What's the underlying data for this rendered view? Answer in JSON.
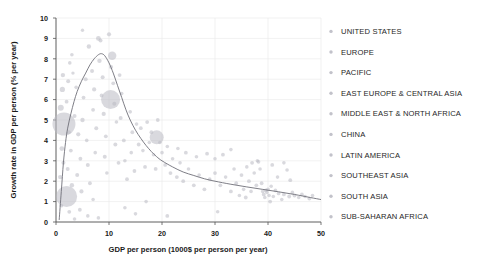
{
  "chart_data": {
    "type": "scatter",
    "title": "",
    "xlabel": "GDP per person (1000$ per person per year)",
    "ylabel": "Growth rate in GDP per person (% per year)",
    "xlim": [
      0,
      50
    ],
    "ylim": [
      0,
      10
    ],
    "xticks": [
      0,
      10,
      20,
      30,
      40,
      50
    ],
    "yticks": [
      0,
      1,
      2,
      3,
      4,
      5,
      6,
      7,
      8,
      9,
      10
    ],
    "grid": true,
    "legend_position": "right",
    "legend": [
      {
        "label": "UNITED STATES",
        "color": "#c2c2ca"
      },
      {
        "label": "EUROPE",
        "color": "#c2c2ca"
      },
      {
        "label": "PACIFIC",
        "color": "#c2c2ca"
      },
      {
        "label": "EAST EUROPE & CENTRAL ASIA",
        "color": "#c2c2ca"
      },
      {
        "label": "MIDDLE EAST & NORTH AFRICA",
        "color": "#c2c2ca"
      },
      {
        "label": "CHINA",
        "color": "#c2c2ca"
      },
      {
        "label": "LATIN AMERICA",
        "color": "#c2c2ca"
      },
      {
        "label": "SOUTHEAST ASIA",
        "color": "#c2c2ca"
      },
      {
        "label": "SOUTH ASIA",
        "color": "#c2c2ca"
      },
      {
        "label": "SUB-SAHARAN AFRICA",
        "color": "#c2c2ca"
      }
    ],
    "trend_line": {
      "name": "fitted growth curve",
      "points": [
        [
          0.6,
          0.1
        ],
        [
          1.0,
          1.5
        ],
        [
          1.4,
          2.9
        ],
        [
          1.8,
          3.9
        ],
        [
          2.2,
          4.6
        ],
        [
          2.8,
          5.3
        ],
        [
          3.4,
          5.9
        ],
        [
          4.0,
          6.4
        ],
        [
          4.8,
          6.9
        ],
        [
          5.6,
          7.3
        ],
        [
          6.4,
          7.7
        ],
        [
          7.2,
          8.0
        ],
        [
          8.0,
          8.2
        ],
        [
          8.6,
          8.25
        ],
        [
          9.2,
          8.15
        ],
        [
          10.0,
          7.8
        ],
        [
          10.8,
          7.3
        ],
        [
          11.6,
          6.7
        ],
        [
          12.4,
          6.1
        ],
        [
          13.2,
          5.5
        ],
        [
          14.0,
          5.0
        ],
        [
          15.0,
          4.5
        ],
        [
          16.0,
          4.1
        ],
        [
          17.0,
          3.75
        ],
        [
          18.0,
          3.45
        ],
        [
          19.0,
          3.2
        ],
        [
          20.0,
          3.0
        ],
        [
          22.0,
          2.7
        ],
        [
          24.0,
          2.45
        ],
        [
          26.0,
          2.28
        ],
        [
          28.0,
          2.12
        ],
        [
          30.0,
          2.0
        ],
        [
          33.0,
          1.85
        ],
        [
          36.0,
          1.72
        ],
        [
          39.0,
          1.6
        ],
        [
          42.0,
          1.48
        ],
        [
          45.0,
          1.35
        ],
        [
          48.0,
          1.2
        ],
        [
          50.0,
          1.1
        ]
      ]
    },
    "points": [
      {
        "x": 1.5,
        "y": 4.8,
        "r": 11.5
      },
      {
        "x": 2.0,
        "y": 1.25,
        "r": 10.5
      },
      {
        "x": 10.3,
        "y": 6.0,
        "r": 9.5
      },
      {
        "x": 19.0,
        "y": 4.15,
        "r": 7.0
      },
      {
        "x": 10.6,
        "y": 8.15,
        "r": 4.2
      },
      {
        "x": 0.9,
        "y": 5.6,
        "r": 3.0
      },
      {
        "x": 1.2,
        "y": 6.5,
        "r": 2.6
      },
      {
        "x": 1.3,
        "y": 7.2,
        "r": 2.2
      },
      {
        "x": 1.1,
        "y": 3.6,
        "r": 2.4
      },
      {
        "x": 1.4,
        "y": 2.9,
        "r": 2.0
      },
      {
        "x": 0.8,
        "y": 2.2,
        "r": 2.2
      },
      {
        "x": 2.3,
        "y": 6.9,
        "r": 2.0
      },
      {
        "x": 2.6,
        "y": 7.8,
        "r": 1.8
      },
      {
        "x": 2.0,
        "y": 5.9,
        "r": 1.9
      },
      {
        "x": 2.4,
        "y": 4.4,
        "r": 2.1
      },
      {
        "x": 2.8,
        "y": 3.5,
        "r": 1.9
      },
      {
        "x": 2.2,
        "y": 2.6,
        "r": 2.0
      },
      {
        "x": 3.0,
        "y": 1.8,
        "r": 2.2
      },
      {
        "x": 3.5,
        "y": 5.2,
        "r": 2.0
      },
      {
        "x": 3.8,
        "y": 6.6,
        "r": 1.8
      },
      {
        "x": 3.2,
        "y": 7.3,
        "r": 1.7
      },
      {
        "x": 4.2,
        "y": 4.3,
        "r": 2.1
      },
      {
        "x": 4.6,
        "y": 3.1,
        "r": 1.9
      },
      {
        "x": 4.0,
        "y": 2.3,
        "r": 2.0
      },
      {
        "x": 4.8,
        "y": 1.5,
        "r": 2.1
      },
      {
        "x": 5.2,
        "y": 6.1,
        "r": 1.9
      },
      {
        "x": 5.6,
        "y": 7.0,
        "r": 2.0
      },
      {
        "x": 5.0,
        "y": 5.0,
        "r": 2.2
      },
      {
        "x": 5.8,
        "y": 4.0,
        "r": 1.8
      },
      {
        "x": 6.0,
        "y": 2.8,
        "r": 2.0
      },
      {
        "x": 6.4,
        "y": 1.9,
        "r": 1.9
      },
      {
        "x": 6.2,
        "y": 8.6,
        "r": 2.2
      },
      {
        "x": 6.8,
        "y": 7.4,
        "r": 2.0
      },
      {
        "x": 7.2,
        "y": 6.5,
        "r": 2.1
      },
      {
        "x": 7.0,
        "y": 5.5,
        "r": 1.9
      },
      {
        "x": 7.6,
        "y": 4.6,
        "r": 2.0
      },
      {
        "x": 7.4,
        "y": 3.4,
        "r": 1.8
      },
      {
        "x": 8.0,
        "y": 9.0,
        "r": 2.4
      },
      {
        "x": 8.4,
        "y": 8.9,
        "r": 2.0
      },
      {
        "x": 8.2,
        "y": 7.9,
        "r": 2.2
      },
      {
        "x": 8.8,
        "y": 7.1,
        "r": 2.0
      },
      {
        "x": 8.6,
        "y": 6.2,
        "r": 1.9
      },
      {
        "x": 9.0,
        "y": 5.3,
        "r": 2.1
      },
      {
        "x": 9.4,
        "y": 4.2,
        "r": 1.9
      },
      {
        "x": 9.2,
        "y": 3.2,
        "r": 2.0
      },
      {
        "x": 9.6,
        "y": 2.4,
        "r": 1.8
      },
      {
        "x": 10.0,
        "y": 9.2,
        "r": 2.1
      },
      {
        "x": 10.4,
        "y": 7.6,
        "r": 2.0
      },
      {
        "x": 10.8,
        "y": 6.8,
        "r": 1.9
      },
      {
        "x": 11.0,
        "y": 5.8,
        "r": 2.0
      },
      {
        "x": 11.4,
        "y": 4.9,
        "r": 1.8
      },
      {
        "x": 11.2,
        "y": 3.8,
        "r": 2.0
      },
      {
        "x": 11.8,
        "y": 2.9,
        "r": 1.9
      },
      {
        "x": 12.0,
        "y": 7.2,
        "r": 1.9
      },
      {
        "x": 12.4,
        "y": 6.3,
        "r": 1.8
      },
      {
        "x": 12.2,
        "y": 5.1,
        "r": 2.0
      },
      {
        "x": 12.8,
        "y": 4.0,
        "r": 1.9
      },
      {
        "x": 13.0,
        "y": 3.0,
        "r": 1.8
      },
      {
        "x": 13.4,
        "y": 2.1,
        "r": 1.9
      },
      {
        "x": 14.0,
        "y": 5.4,
        "r": 1.8
      },
      {
        "x": 14.4,
        "y": 4.4,
        "r": 1.9
      },
      {
        "x": 14.2,
        "y": 3.4,
        "r": 1.8
      },
      {
        "x": 14.8,
        "y": 2.5,
        "r": 1.9
      },
      {
        "x": 15.2,
        "y": 4.8,
        "r": 1.8
      },
      {
        "x": 15.6,
        "y": 3.8,
        "r": 1.9
      },
      {
        "x": 15.0,
        "y": 0.4,
        "r": 1.8
      },
      {
        "x": 16.0,
        "y": 4.6,
        "r": 1.9
      },
      {
        "x": 16.4,
        "y": 3.5,
        "r": 1.8
      },
      {
        "x": 16.8,
        "y": 2.7,
        "r": 1.9
      },
      {
        "x": 17.2,
        "y": 4.9,
        "r": 1.9
      },
      {
        "x": 17.6,
        "y": 3.9,
        "r": 1.8
      },
      {
        "x": 17.0,
        "y": 1.0,
        "r": 1.8
      },
      {
        "x": 18.0,
        "y": 4.4,
        "r": 1.9
      },
      {
        "x": 18.4,
        "y": 3.3,
        "r": 1.8
      },
      {
        "x": 18.8,
        "y": 2.6,
        "r": 1.9
      },
      {
        "x": 19.6,
        "y": 3.9,
        "r": 1.8
      },
      {
        "x": 19.2,
        "y": 5.0,
        "r": 1.9
      },
      {
        "x": 20.0,
        "y": 3.4,
        "r": 1.8
      },
      {
        "x": 20.6,
        "y": 2.8,
        "r": 1.9
      },
      {
        "x": 21.0,
        "y": 3.7,
        "r": 1.8
      },
      {
        "x": 21.6,
        "y": 2.4,
        "r": 1.9
      },
      {
        "x": 22.0,
        "y": 3.1,
        "r": 1.8
      },
      {
        "x": 22.8,
        "y": 2.2,
        "r": 1.9
      },
      {
        "x": 23.4,
        "y": 2.9,
        "r": 1.8
      },
      {
        "x": 24.0,
        "y": 2.0,
        "r": 1.9
      },
      {
        "x": 25.0,
        "y": 2.6,
        "r": 1.8
      },
      {
        "x": 26.0,
        "y": 1.8,
        "r": 1.9
      },
      {
        "x": 27.0,
        "y": 2.3,
        "r": 1.8
      },
      {
        "x": 28.0,
        "y": 1.6,
        "r": 1.9
      },
      {
        "x": 29.0,
        "y": 2.1,
        "r": 1.8
      },
      {
        "x": 30.0,
        "y": 2.4,
        "r": 1.9
      },
      {
        "x": 30.5,
        "y": 0.5,
        "r": 1.8
      },
      {
        "x": 31.0,
        "y": 1.8,
        "r": 1.9
      },
      {
        "x": 32.0,
        "y": 2.2,
        "r": 1.8
      },
      {
        "x": 33.0,
        "y": 1.5,
        "r": 1.9
      },
      {
        "x": 33.6,
        "y": 2.6,
        "r": 1.8
      },
      {
        "x": 34.0,
        "y": 1.9,
        "r": 1.9
      },
      {
        "x": 34.6,
        "y": 1.3,
        "r": 1.8
      },
      {
        "x": 35.0,
        "y": 2.3,
        "r": 1.9
      },
      {
        "x": 35.4,
        "y": 1.6,
        "r": 1.8
      },
      {
        "x": 35.8,
        "y": 1.2,
        "r": 1.9
      },
      {
        "x": 36.0,
        "y": 2.7,
        "r": 1.8
      },
      {
        "x": 36.4,
        "y": 2.0,
        "r": 1.9
      },
      {
        "x": 36.8,
        "y": 1.5,
        "r": 1.8
      },
      {
        "x": 37.0,
        "y": 2.9,
        "r": 1.9
      },
      {
        "x": 37.4,
        "y": 2.4,
        "r": 1.8
      },
      {
        "x": 37.8,
        "y": 1.8,
        "r": 1.9
      },
      {
        "x": 38.0,
        "y": 3.0,
        "r": 1.8
      },
      {
        "x": 38.2,
        "y": 2.95,
        "r": 1.9
      },
      {
        "x": 38.5,
        "y": 2.6,
        "r": 1.8
      },
      {
        "x": 38.8,
        "y": 1.9,
        "r": 1.9
      },
      {
        "x": 39.0,
        "y": 1.5,
        "r": 1.8
      },
      {
        "x": 39.2,
        "y": 1.35,
        "r": 1.9
      },
      {
        "x": 39.4,
        "y": 1.2,
        "r": 1.8
      },
      {
        "x": 39.6,
        "y": 1.55,
        "r": 1.9
      },
      {
        "x": 39.8,
        "y": 1.45,
        "r": 1.8
      },
      {
        "x": 40.0,
        "y": 1.6,
        "r": 1.9
      },
      {
        "x": 40.2,
        "y": 1.3,
        "r": 1.8
      },
      {
        "x": 40.4,
        "y": 1.0,
        "r": 1.9
      },
      {
        "x": 40.6,
        "y": 1.75,
        "r": 1.8
      },
      {
        "x": 40.8,
        "y": 2.8,
        "r": 1.9
      },
      {
        "x": 41.0,
        "y": 1.25,
        "r": 1.8
      },
      {
        "x": 41.4,
        "y": 1.55,
        "r": 1.9
      },
      {
        "x": 41.8,
        "y": 2.2,
        "r": 1.8
      },
      {
        "x": 42.0,
        "y": 1.4,
        "r": 1.9
      },
      {
        "x": 42.6,
        "y": 1.1,
        "r": 1.8
      },
      {
        "x": 43.0,
        "y": 1.35,
        "r": 1.9
      },
      {
        "x": 43.6,
        "y": 2.55,
        "r": 1.8
      },
      {
        "x": 44.0,
        "y": 1.25,
        "r": 1.9
      },
      {
        "x": 44.6,
        "y": 1.45,
        "r": 1.8
      },
      {
        "x": 45.0,
        "y": 1.3,
        "r": 1.9
      },
      {
        "x": 45.8,
        "y": 1.2,
        "r": 1.8
      },
      {
        "x": 46.4,
        "y": 1.35,
        "r": 1.9
      },
      {
        "x": 47.0,
        "y": 1.25,
        "r": 1.8
      },
      {
        "x": 47.8,
        "y": 1.15,
        "r": 1.9
      },
      {
        "x": 48.4,
        "y": 1.3,
        "r": 1.8
      },
      {
        "x": 33.0,
        "y": 3.55,
        "r": 1.8
      },
      {
        "x": 31.5,
        "y": 3.3,
        "r": 1.9
      },
      {
        "x": 30.0,
        "y": 3.1,
        "r": 1.8
      },
      {
        "x": 28.5,
        "y": 3.35,
        "r": 1.9
      },
      {
        "x": 43.0,
        "y": 2.9,
        "r": 1.8
      },
      {
        "x": 44.2,
        "y": 2.05,
        "r": 1.9
      },
      {
        "x": 26.5,
        "y": 3.2,
        "r": 1.8
      },
      {
        "x": 24.5,
        "y": 3.4,
        "r": 1.9
      },
      {
        "x": 23.0,
        "y": 3.6,
        "r": 1.8
      },
      {
        "x": 8.0,
        "y": 0.2,
        "r": 1.8
      },
      {
        "x": 4.5,
        "y": 0.6,
        "r": 1.9
      },
      {
        "x": 6.0,
        "y": 0.3,
        "r": 1.8
      },
      {
        "x": 2.5,
        "y": 0.5,
        "r": 1.9
      },
      {
        "x": 3.5,
        "y": 0.15,
        "r": 1.8
      },
      {
        "x": 1.0,
        "y": 0.8,
        "r": 1.9
      },
      {
        "x": 13.0,
        "y": 0.7,
        "r": 1.8
      },
      {
        "x": 21.0,
        "y": 0.3,
        "r": 1.9
      },
      {
        "x": 7.0,
        "y": 1.1,
        "r": 1.8
      },
      {
        "x": 5.0,
        "y": 9.4,
        "r": 1.7
      },
      {
        "x": 3.0,
        "y": 8.2,
        "r": 1.8
      }
    ]
  }
}
